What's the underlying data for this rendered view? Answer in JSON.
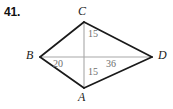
{
  "problem": {
    "number": "41."
  },
  "figure": {
    "type": "kite-diagram",
    "background_color": "#ffffff",
    "outline_color": "#1a1a1a",
    "diagonal_color": "#a8a8a8",
    "label_color": "#1a1a1a",
    "measure_color": "#6e6e6e",
    "vertices": [
      {
        "name": "C",
        "label": "C",
        "x": 84,
        "y": 22,
        "position": "top"
      },
      {
        "name": "B",
        "label": "B",
        "x": 40,
        "y": 57,
        "position": "left"
      },
      {
        "name": "D",
        "label": "D",
        "x": 152,
        "y": 57,
        "position": "right"
      },
      {
        "name": "A",
        "label": "A",
        "x": 84,
        "y": 88,
        "position": "bottom"
      }
    ],
    "edges": [
      {
        "name": "edge-BC",
        "from": "B",
        "to": "C"
      },
      {
        "name": "edge-CD",
        "from": "C",
        "to": "D"
      },
      {
        "name": "edge-BA",
        "from": "B",
        "to": "A"
      },
      {
        "name": "edge-AD",
        "from": "A",
        "to": "D"
      }
    ],
    "diagonals": [
      {
        "name": "diagonal-BD",
        "from": "B",
        "to": "D"
      },
      {
        "name": "diagonal-CA",
        "from": "C",
        "to": "A"
      }
    ],
    "measures": [
      {
        "name": "measure-top",
        "value": "15",
        "segment": "C-to-center"
      },
      {
        "name": "measure-bottom",
        "value": "15",
        "segment": "center-to-A"
      },
      {
        "name": "measure-left",
        "value": "20",
        "segment": "B-to-center"
      },
      {
        "name": "measure-right",
        "value": "36",
        "segment": "center-to-D"
      }
    ]
  }
}
